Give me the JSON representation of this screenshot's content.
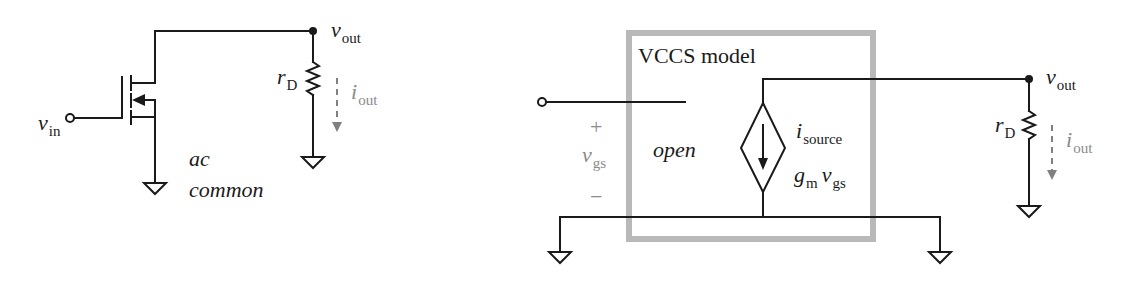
{
  "left_circuit": {
    "input_label": {
      "main": "v",
      "sub": "in"
    },
    "output_label": {
      "main": "v",
      "sub": "out"
    },
    "resistor_label": {
      "main": "r",
      "sub": "D"
    },
    "current_label": {
      "main": "i",
      "sub": "out"
    },
    "note_line1": "ac",
    "note_line2": "common"
  },
  "right_circuit": {
    "model_box_title": "VCCS model",
    "input_label": {
      "main": "v",
      "sub": "in"
    },
    "vgs_label": {
      "main": "v",
      "sub": "gs"
    },
    "plus_sign": "+",
    "minus_sign": "−",
    "open_label": "open",
    "source_current_label": {
      "main": "i",
      "sub": "source"
    },
    "source_value_label": {
      "g": "g",
      "g_sub": "m",
      "v": "v",
      "v_sub": "gs"
    },
    "output_label": {
      "main": "v",
      "sub": "out"
    },
    "resistor_label": {
      "main": "r",
      "sub": "D"
    },
    "current_label": {
      "main": "i",
      "sub": "out"
    }
  },
  "colors": {
    "wire": "#1a1a1a",
    "model_box": "#b9b9b9",
    "annotation_gray": "#8a8a8a"
  }
}
